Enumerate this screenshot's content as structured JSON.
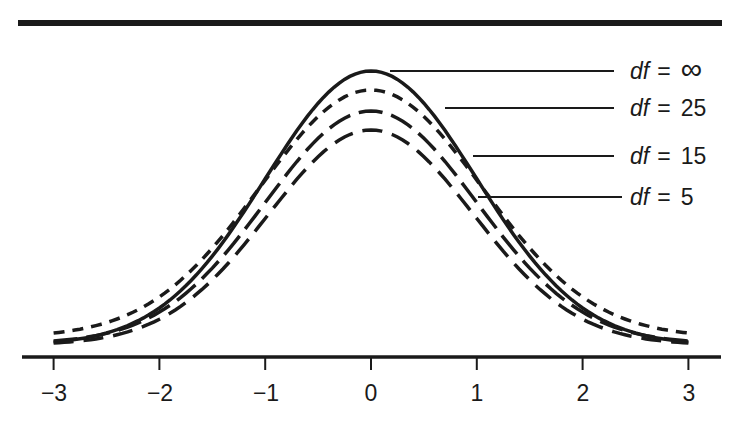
{
  "chart_data": {
    "type": "line",
    "title": "",
    "xlabel": "",
    "ylabel": "",
    "xlim": [
      -3,
      3
    ],
    "grid": false,
    "x_ticks": [
      "−3",
      "−2",
      "−1",
      "0",
      "1",
      "2",
      "3"
    ],
    "legend_position": "right, leader lines to curves",
    "series": [
      {
        "name": "df = ∞",
        "df_symbol": "df",
        "df_value": "∞",
        "style": "solid",
        "peak_px": 71,
        "tail_px": 342
      },
      {
        "name": "df = 25",
        "df_symbol": "df",
        "df_value": "25",
        "style": "short-dash",
        "peak_px": 90,
        "tail_px": 333
      },
      {
        "name": "df = 15",
        "df_symbol": "df",
        "df_value": "15",
        "style": "long-dash",
        "peak_px": 111,
        "tail_px": 341
      },
      {
        "name": "df = 5",
        "df_symbol": "df",
        "df_value": "5",
        "style": "long-dash",
        "peak_px": 130,
        "tail_px": 343
      }
    ]
  },
  "labels": {
    "eq": "=",
    "l0": {
      "sym": "df",
      "val": "∞"
    },
    "l1": {
      "sym": "df",
      "val": "25"
    },
    "l2": {
      "sym": "df",
      "val": "15"
    },
    "l3": {
      "sym": "df",
      "val": "5"
    }
  },
  "ticks": [
    "−3",
    "−2",
    "−1",
    "0",
    "1",
    "2",
    "3"
  ]
}
